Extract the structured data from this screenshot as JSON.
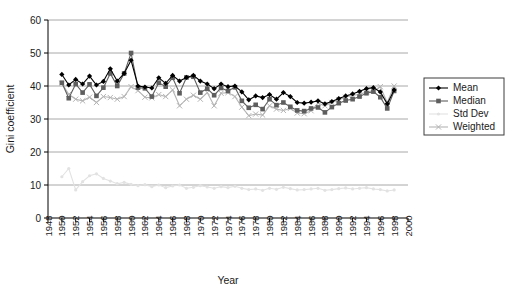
{
  "chart_data": {
    "type": "line",
    "title": "",
    "xlabel": "Year",
    "ylabel": "Gini coefficient",
    "xlim": [
      1948,
      2000
    ],
    "ylim": [
      0,
      60
    ],
    "yticks": [
      0,
      10,
      20,
      30,
      40,
      50,
      60
    ],
    "xticks": [
      1948,
      1950,
      1952,
      1954,
      1956,
      1958,
      1960,
      1962,
      1964,
      1966,
      1968,
      1970,
      1972,
      1974,
      1976,
      1978,
      1980,
      1982,
      1984,
      1986,
      1988,
      1990,
      1992,
      1994,
      1996,
      1998,
      2000
    ],
    "grid": "horizontal",
    "legend_position": "right",
    "x": [
      1950,
      1951,
      1952,
      1953,
      1954,
      1955,
      1956,
      1957,
      1958,
      1959,
      1960,
      1961,
      1962,
      1963,
      1964,
      1965,
      1966,
      1967,
      1968,
      1969,
      1970,
      1971,
      1972,
      1973,
      1974,
      1975,
      1976,
      1977,
      1978,
      1979,
      1980,
      1981,
      1982,
      1983,
      1984,
      1985,
      1986,
      1987,
      1988,
      1989,
      1990,
      1991,
      1992,
      1993,
      1994,
      1995,
      1996,
      1997,
      1998
    ],
    "series": [
      {
        "name": "Mean",
        "color": "#000000",
        "marker": "diamond",
        "values": [
          43.5,
          40.3,
          42.0,
          40.6,
          43.0,
          40.3,
          41.4,
          45.2,
          41.5,
          43.8,
          47.8,
          40.0,
          39.7,
          39.4,
          42.5,
          40.8,
          43.2,
          41.5,
          42.6,
          43.2,
          41.5,
          40.6,
          39.2,
          40.6,
          39.8,
          40.0,
          38.2,
          35.8,
          37.0,
          36.5,
          37.4,
          36.0,
          38.0,
          36.8,
          35.0,
          34.8,
          35.1,
          35.5,
          34.6,
          35.3,
          36.2,
          37.0,
          37.6,
          38.4,
          39.2,
          39.5,
          38.2,
          34.6,
          38.8
        ]
      },
      {
        "name": "Median",
        "color": "#5e5e5e",
        "marker": "square",
        "values": [
          41.0,
          36.3,
          40.6,
          38.0,
          40.5,
          37.0,
          39.5,
          43.8,
          40.0,
          43.8,
          50.0,
          39.5,
          39.3,
          36.8,
          41.0,
          39.8,
          42.5,
          37.8,
          42.6,
          42.8,
          38.0,
          39.2,
          37.2,
          39.4,
          38.5,
          39.6,
          35.5,
          33.4,
          34.3,
          33.0,
          36.0,
          34.2,
          35.0,
          33.7,
          32.6,
          32.4,
          33.2,
          33.5,
          32.0,
          33.6,
          34.8,
          35.6,
          36.0,
          36.8,
          37.8,
          38.3,
          36.6,
          33.2,
          38.5
        ]
      },
      {
        "name": "Std Dev",
        "color": "#e2e2e2",
        "marker": "dot",
        "values": [
          12.5,
          15.0,
          8.5,
          11.0,
          12.8,
          13.4,
          12.0,
          11.2,
          10.4,
          10.8,
          10.2,
          9.8,
          10.1,
          9.5,
          10.0,
          9.2,
          9.7,
          10.0,
          9.0,
          9.3,
          9.8,
          9.4,
          9.0,
          9.5,
          9.2,
          9.6,
          9.0,
          8.6,
          8.8,
          8.4,
          9.0,
          8.7,
          9.3,
          8.9,
          8.5,
          8.6,
          8.8,
          9.0,
          8.4,
          8.6,
          8.9,
          9.1,
          8.8,
          9.0,
          9.2,
          8.8,
          8.6,
          8.2,
          8.5
        ]
      },
      {
        "name": "Weighted",
        "color": "#b4b4b4",
        "marker": "cross",
        "values": [
          40.8,
          37.5,
          36.0,
          35.5,
          36.6,
          35.0,
          36.8,
          36.5,
          36.0,
          36.8,
          39.8,
          38.6,
          36.6,
          36.4,
          37.4,
          36.8,
          38.8,
          34.0,
          36.0,
          37.2,
          36.0,
          38.0,
          34.0,
          37.8,
          38.0,
          36.8,
          33.6,
          31.0,
          31.5,
          31.2,
          34.0,
          33.0,
          32.6,
          33.2,
          31.8,
          31.6,
          32.5,
          34.8,
          34.0,
          35.0,
          35.8,
          36.6,
          37.2,
          37.4,
          38.2,
          38.6,
          39.8,
          35.0,
          40.0
        ]
      }
    ]
  },
  "legend": {
    "items": [
      {
        "label": "Mean"
      },
      {
        "label": "Median"
      },
      {
        "label": "Std Dev"
      },
      {
        "label": "Weighted"
      }
    ]
  }
}
